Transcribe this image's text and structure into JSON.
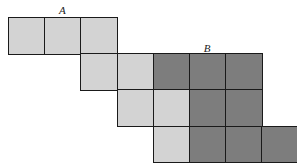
{
  "diagram": {
    "grid": {
      "origin_x": 8,
      "origin_y": 17,
      "cell_size": 36.2
    },
    "colors": {
      "light": "#d3d3d3",
      "dark": "#7d7d7d",
      "border": "#1a1a1a"
    },
    "labels": [
      {
        "text": "A",
        "col": 1,
        "y": 5
      },
      {
        "text": "B",
        "col": 5,
        "y": 43
      }
    ],
    "cells": [
      {
        "row": 0,
        "col": 0,
        "shade": "light"
      },
      {
        "row": 0,
        "col": 1,
        "shade": "light"
      },
      {
        "row": 0,
        "col": 2,
        "shade": "light"
      },
      {
        "row": 1,
        "col": 2,
        "shade": "light"
      },
      {
        "row": 1,
        "col": 3,
        "shade": "light"
      },
      {
        "row": 1,
        "col": 4,
        "shade": "dark"
      },
      {
        "row": 1,
        "col": 5,
        "shade": "dark"
      },
      {
        "row": 1,
        "col": 6,
        "shade": "dark"
      },
      {
        "row": 2,
        "col": 3,
        "shade": "light"
      },
      {
        "row": 2,
        "col": 4,
        "shade": "light"
      },
      {
        "row": 2,
        "col": 5,
        "shade": "dark"
      },
      {
        "row": 2,
        "col": 6,
        "shade": "dark"
      },
      {
        "row": 3,
        "col": 4,
        "shade": "light"
      },
      {
        "row": 3,
        "col": 5,
        "shade": "dark"
      },
      {
        "row": 3,
        "col": 6,
        "shade": "dark"
      },
      {
        "row": 3,
        "col": 7,
        "shade": "dark"
      }
    ]
  }
}
